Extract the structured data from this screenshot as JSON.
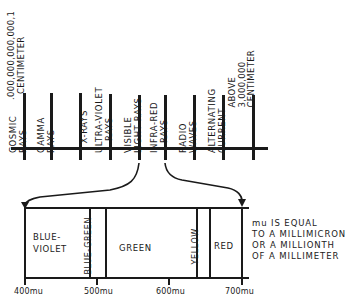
{
  "spectrum": {
    "left_limit_label": [
      ".000,000,000,000,1",
      "CENTIMETER"
    ],
    "right_limit_label": [
      "ABOVE",
      "3,000,000",
      "CENTIMETER"
    ],
    "bands": [
      {
        "lines": [
          "COSMIC",
          "RAYS"
        ]
      },
      {
        "lines": [
          "GAMMA",
          "RAYS"
        ]
      },
      {
        "lines": [
          "X-RAYS"
        ]
      },
      {
        "lines": [
          "ULTRA-VIOLET",
          "RAYS"
        ]
      },
      {
        "lines": [
          "VISIBLE",
          "LIGHT RAYS"
        ]
      },
      {
        "lines": [
          "INFRA-RED",
          "RAYS"
        ]
      },
      {
        "lines": [
          "RADIO",
          "WAVES"
        ]
      },
      {
        "lines": [
          "ALTERNATING",
          "CURRENT"
        ]
      }
    ]
  },
  "visible_spectrum": {
    "segments": [
      {
        "label_lines": [
          "BLUE-",
          "VIOLET"
        ],
        "orientation": "horizontal"
      },
      {
        "label_lines": [
          "BLUE-GREEN"
        ],
        "orientation": "vertical"
      },
      {
        "label_lines": [
          "GREEN"
        ],
        "orientation": "horizontal"
      },
      {
        "label_lines": [
          "YELLOW"
        ],
        "orientation": "vertical"
      },
      {
        "label_lines": [
          "RED"
        ],
        "orientation": "horizontal"
      }
    ],
    "ticks": [
      "400mu",
      "500mu",
      "600mu",
      "700mu"
    ]
  },
  "note": {
    "lines": [
      "mu IS EQUAL",
      "TO A MILLIMICRON",
      "OR A MILLIONTH",
      "OF A MILLIMETER"
    ]
  }
}
